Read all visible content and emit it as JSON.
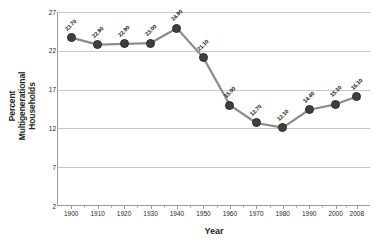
{
  "chart_data": {
    "type": "line",
    "title": "",
    "subtitle": "",
    "xlabel": "Year",
    "ylabel": "Percent Multigenerational Households",
    "ylabel_lines": [
      "Percent",
      "Multigenerational",
      "Households"
    ],
    "categories": [
      "1900",
      "1910",
      "1920",
      "1930",
      "1940",
      "1950",
      "1960",
      "1970",
      "1980",
      "1990",
      "2000",
      "2008"
    ],
    "x": [
      1900,
      1910,
      1920,
      1930,
      1940,
      1950,
      1960,
      1970,
      1980,
      1990,
      2000,
      2008
    ],
    "values": [
      23.7,
      22.8,
      22.9,
      23.0,
      24.9,
      21.1,
      15.0,
      12.7,
      12.1,
      14.4,
      15.1,
      16.1
    ],
    "point_labels": [
      "23.70",
      "22.80",
      "22.90",
      "23.00",
      "24.90",
      "21.10",
      "15.00",
      "12.70",
      "12.10",
      "14.40",
      "15.10",
      "16.10"
    ],
    "ylim": [
      2,
      27
    ],
    "yticks": [
      2,
      7,
      12,
      17,
      22,
      27
    ],
    "ytick_labels": [
      "2",
      "7",
      "12",
      "17",
      "22",
      "27"
    ],
    "xlim": [
      1895,
      2013
    ],
    "grid": true,
    "grid_axis": "y",
    "legend": false,
    "legend_position": "none",
    "series": [
      {
        "name": "Percent Multigenerational Households",
        "values": [
          23.7,
          22.8,
          22.9,
          23.0,
          24.9,
          21.1,
          15.0,
          12.7,
          12.1,
          14.4,
          15.1,
          16.1
        ]
      }
    ],
    "colors": {
      "line": "#8c8c8c",
      "marker": "#3f3f3f",
      "marker_edge": "#2a2a2a",
      "grid": "#c8c8c8",
      "axis": "#9a9a9a",
      "text": "#231f20",
      "background": "#ffffff"
    }
  }
}
